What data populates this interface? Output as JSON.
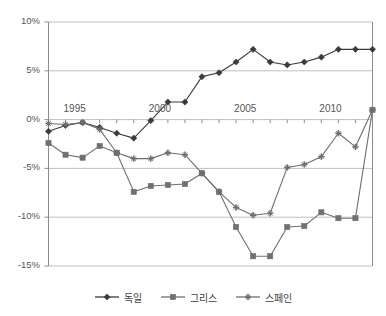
{
  "chart_data": {
    "type": "line",
    "title": "",
    "subtitle": "",
    "xlabel": "",
    "ylabel": "",
    "xlim": [
      1994,
      2013
    ],
    "ylim": [
      -15,
      10
    ],
    "ytick_labels": [
      "10%",
      "5%",
      "0%",
      "-5%",
      "-10%",
      "-15%"
    ],
    "ytick_values": [
      10,
      5,
      0,
      -5,
      -10,
      -15
    ],
    "xtick_labels": [
      "1995",
      "2000",
      "2005",
      "2010"
    ],
    "xtick_values": [
      1995,
      2000,
      2005,
      2010
    ],
    "grid": "horizontal",
    "legend_position": "bottom",
    "x": [
      1994,
      1995,
      1996,
      1997,
      1998,
      1999,
      2000,
      2001,
      2002,
      2003,
      2004,
      2005,
      2006,
      2007,
      2008,
      2009,
      2010,
      2011,
      2012,
      2013
    ],
    "series": [
      {
        "name": "독일",
        "marker": "diamond",
        "color": "#3a3a3a",
        "values": [
          -1.2,
          -0.6,
          -0.3,
          -0.8,
          -1.4,
          -1.9,
          -0.1,
          1.8,
          1.8,
          4.4,
          4.8,
          5.9,
          7.2,
          5.9,
          5.6,
          5.9,
          6.4,
          7.2,
          7.2,
          7.2
        ]
      },
      {
        "name": "그리스",
        "marker": "square",
        "color": "#707070",
        "values": [
          -2.4,
          -3.6,
          -3.9,
          -2.7,
          -3.4,
          -7.4,
          -6.8,
          -6.7,
          -6.6,
          -5.5,
          -7.4,
          -11.0,
          -14.0,
          -14.0,
          -11.0,
          -10.9,
          -9.5,
          -10.1,
          -10.1,
          1.0
        ]
      },
      {
        "name": "스페인",
        "marker": "cross",
        "color": "#6e6e6e",
        "values": [
          -0.4,
          -0.5,
          -0.3,
          -1.0,
          -3.4,
          -4.0,
          -4.0,
          -3.4,
          -3.6,
          -5.5,
          -7.4,
          -9.0,
          -9.8,
          -9.6,
          -4.9,
          -4.6,
          -3.8,
          -1.4,
          -2.8,
          1.0
        ]
      }
    ]
  },
  "axis": {
    "y_labels": [
      {
        "text": "10%",
        "value": 10
      },
      {
        "text": "5%",
        "value": 5
      },
      {
        "text": "0%",
        "value": 0
      },
      {
        "text": "-5%",
        "value": -5
      },
      {
        "text": "-10%",
        "value": -10
      },
      {
        "text": "-15%",
        "value": -15
      }
    ],
    "x_labels": [
      {
        "text": "1995",
        "value": 1995
      },
      {
        "text": "2000",
        "value": 2000
      },
      {
        "text": "2005",
        "value": 2005
      },
      {
        "text": "2010",
        "value": 2010
      }
    ]
  },
  "legend": {
    "items": [
      {
        "label": "독일",
        "marker": "diamond",
        "color": "#3a3a3a"
      },
      {
        "label": "그리스",
        "marker": "square",
        "color": "#707070"
      },
      {
        "label": "스페인",
        "marker": "cross",
        "color": "#6e6e6e"
      }
    ]
  },
  "colors": {
    "germany": "#3a3a3a",
    "greece": "#707070",
    "spain": "#6e6e6e",
    "gridline": "#bfbfbf",
    "axis": "#8c8c8c",
    "text": "#555555"
  }
}
